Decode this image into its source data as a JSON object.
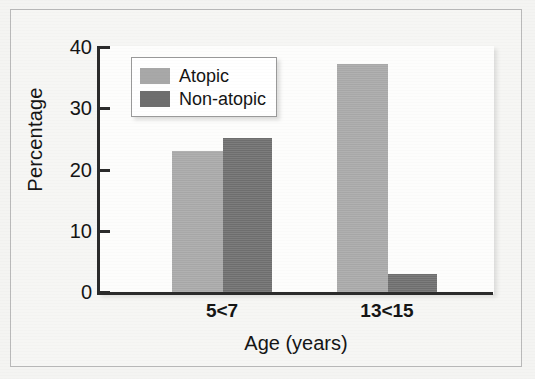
{
  "chart_data": {
    "type": "bar",
    "title": "",
    "xlabel": "Age (years)",
    "ylabel": "Percentage",
    "categories": [
      "5<7",
      "13<15"
    ],
    "series": [
      {
        "name": "Atopic",
        "color": "#a8a8a8",
        "values": [
          23,
          37
        ]
      },
      {
        "name": "Non-atopic",
        "color": "#6e6e6e",
        "values": [
          25,
          3
        ]
      }
    ],
    "ylim": [
      0,
      40
    ],
    "yticks": [
      0,
      10,
      20,
      30,
      40
    ],
    "ytick_labels": [
      "0",
      "10",
      "20",
      "30",
      "40"
    ],
    "grid": false,
    "legend_position": "upper left"
  },
  "axes": {
    "y_title": "Percentage",
    "x_title": "Age (years)",
    "y_tick_0": "0",
    "y_tick_1": "10",
    "y_tick_2": "20",
    "y_tick_3": "30",
    "y_tick_4": "40",
    "x_tick_0": "5<7",
    "x_tick_1": "13<15"
  },
  "legend": {
    "items": [
      {
        "label": "Atopic",
        "color": "#a8a8a8"
      },
      {
        "label": "Non-atopic",
        "color": "#6e6e6e"
      }
    ]
  },
  "colors": {
    "atopic": "#a8a8a8",
    "non_atopic": "#6e6e6e",
    "axis": "#2b2b2b",
    "page_background": "#f4f4f2",
    "plot_background": "#fdfdfc",
    "frame_border": "#b9b9b9"
  }
}
